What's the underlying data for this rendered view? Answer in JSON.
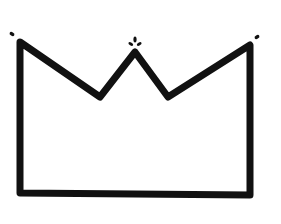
{
  "figure": {
    "colors": {
      "background": "#ffffff",
      "stroke": "#111111"
    },
    "stroke_width": 7,
    "outline_points": [
      [
        20,
        42
      ],
      [
        100,
        97
      ],
      [
        135,
        52
      ],
      [
        168,
        97
      ],
      [
        250,
        45
      ],
      [
        250,
        195
      ],
      [
        20,
        193
      ]
    ],
    "ornaments": [
      {
        "name": "left-tip-dot",
        "cx": 12,
        "cy": 34
      },
      {
        "name": "center-leaf",
        "cx": 135,
        "cy": 42
      },
      {
        "name": "right-tip-dot",
        "cx": 257,
        "cy": 37
      }
    ]
  }
}
